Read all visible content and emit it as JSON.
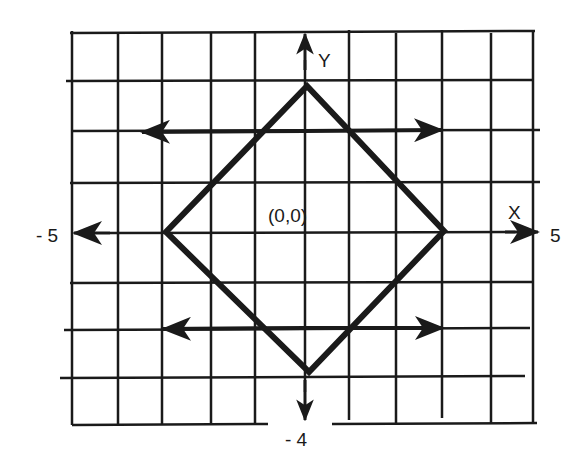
{
  "diagram": {
    "type": "coordinate-grid-diagram",
    "labels": {
      "y_axis": "Y",
      "x_axis": "X",
      "origin": "(0,0)",
      "x_min": "- 5",
      "x_max": "5",
      "y_min": "- 4"
    },
    "shape": {
      "name": "diamond",
      "vertices": [
        [
          0,
          3
        ],
        [
          3,
          0
        ],
        [
          0,
          -3
        ],
        [
          -3,
          0
        ]
      ]
    },
    "arrows": [
      {
        "name": "upper-left-arrow",
        "direction": "left",
        "y": 2
      },
      {
        "name": "upper-right-arrow",
        "direction": "right",
        "y": 2
      },
      {
        "name": "lower-left-arrow",
        "direction": "left",
        "y": -2
      },
      {
        "name": "lower-right-arrow",
        "direction": "right",
        "y": -2
      }
    ],
    "colors": {
      "ink": "#1a1a1a",
      "background": "#ffffff"
    }
  }
}
